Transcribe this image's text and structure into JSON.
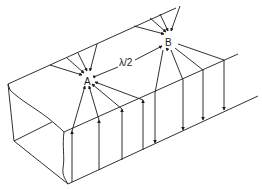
{
  "diagram": {
    "labels": {
      "point_a": "A",
      "point_b": "B",
      "separation": "λ/2"
    },
    "field_directions": {
      "near_a": "arrows point up toward top face, converging on A",
      "near_b": "arrows point down from top face, diverging from B"
    }
  }
}
